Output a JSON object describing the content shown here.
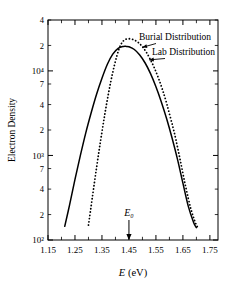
{
  "chart_data": {
    "type": "line",
    "title": "",
    "xlabel": "E (eV)",
    "ylabel": "Electron Density",
    "xlim": [
      1.15,
      1.78
    ],
    "ylim": [
      100,
      40000
    ],
    "yscale": "log",
    "xscale": "linear",
    "grid": false,
    "legend_position": "inline-annotations",
    "x_ticks_major": [
      1.15,
      1.25,
      1.35,
      1.45,
      1.55,
      1.65,
      1.75
    ],
    "x_tick_labels": [
      "1.15",
      "1.25",
      "1.35",
      "1.45",
      "1.55",
      "1.65",
      "1.75"
    ],
    "x_ticks_minor": [
      1.2,
      1.3,
      1.4,
      1.5,
      1.6,
      1.7
    ],
    "y_ticks": [
      100,
      200,
      400,
      700,
      1000,
      2000,
      4000,
      7000,
      10000,
      20000,
      40000
    ],
    "y_tick_labels": [
      "10²",
      "2",
      "4",
      "7",
      "10³",
      "2",
      "4",
      "7",
      "10⁴",
      "2",
      "4"
    ],
    "annotations": [
      {
        "name": "burial-label",
        "text": "Burial Distribution",
        "target_x": 1.5,
        "target_y": 19000
      },
      {
        "name": "lab-label",
        "text": "Lab Distribution",
        "target_x": 1.525,
        "target_y": 13500
      },
      {
        "name": "e0-marker",
        "text": "E₀",
        "target_x": 1.45,
        "target_y": 100
      }
    ],
    "series": [
      {
        "name": "Lab Distribution",
        "style": "solid",
        "color": "#000000",
        "peak_x": 1.44,
        "peak_y": 19500,
        "x_start": 1.212,
        "x_end": 1.7,
        "x": [
          1.212,
          1.23,
          1.25,
          1.27,
          1.29,
          1.31,
          1.33,
          1.35,
          1.37,
          1.39,
          1.41,
          1.43,
          1.44,
          1.45,
          1.47,
          1.49,
          1.51,
          1.53,
          1.55,
          1.57,
          1.59,
          1.61,
          1.63,
          1.65,
          1.67,
          1.69,
          1.7
        ],
        "y": [
          145,
          260,
          520,
          1000,
          1850,
          3200,
          5300,
          8200,
          12000,
          15800,
          18500,
          19480,
          19500,
          19300,
          17900,
          15400,
          12400,
          9300,
          6500,
          4300,
          2700,
          1600,
          900,
          470,
          250,
          160,
          140
        ]
      },
      {
        "name": "Burial Distribution",
        "style": "dotted",
        "color": "#000000",
        "peak_x": 1.452,
        "peak_y": 24000,
        "x_start": 1.3,
        "x_end": 1.71,
        "x": [
          1.3,
          1.315,
          1.33,
          1.345,
          1.36,
          1.375,
          1.39,
          1.405,
          1.42,
          1.435,
          1.452,
          1.47,
          1.485,
          1.5,
          1.515,
          1.53,
          1.545,
          1.56,
          1.575,
          1.59,
          1.605,
          1.62,
          1.64,
          1.66,
          1.68,
          1.7,
          1.71
        ],
        "y": [
          150,
          330,
          720,
          1500,
          3000,
          5600,
          9600,
          15000,
          20500,
          23400,
          24000,
          23200,
          21600,
          19300,
          16500,
          13500,
          10700,
          8100,
          5900,
          4100,
          2700,
          1750,
          880,
          430,
          230,
          150,
          140
        ]
      }
    ]
  },
  "axes": {
    "ylabel_text": "Electron Density",
    "xlabel_italic": "E",
    "xlabel_unit": "(eV)"
  }
}
